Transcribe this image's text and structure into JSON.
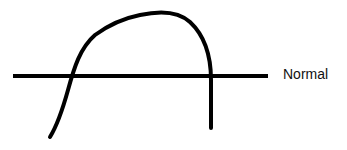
{
  "diagram": {
    "baseline_label": "Normal",
    "elements": [
      {
        "type": "horizontal-line",
        "meaning": "normal level baseline"
      },
      {
        "type": "curve",
        "meaning": "rises from below baseline, peaks above it, then drops sharply back below baseline"
      }
    ],
    "colors": {
      "stroke": "#000000",
      "background": "#ffffff",
      "label": "#111111"
    }
  }
}
